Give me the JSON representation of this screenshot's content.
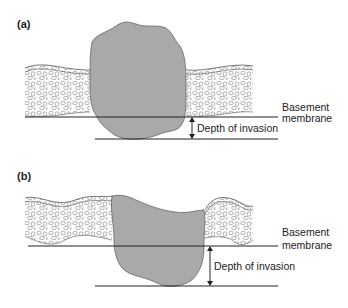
{
  "figure": {
    "panels": [
      {
        "label": "(a)",
        "basement_label_line1": "Basement",
        "basement_label_line2": "membrane",
        "depth_label": "Depth of invasion"
      },
      {
        "label": "(b)",
        "basement_label_line1": "Basement",
        "basement_label_line2": "membrane",
        "depth_label": "Depth of invasion"
      }
    ],
    "colors": {
      "tumor_fill": "#a9a9a9",
      "line": "#222222",
      "epithelium_stroke": "#555555"
    }
  }
}
